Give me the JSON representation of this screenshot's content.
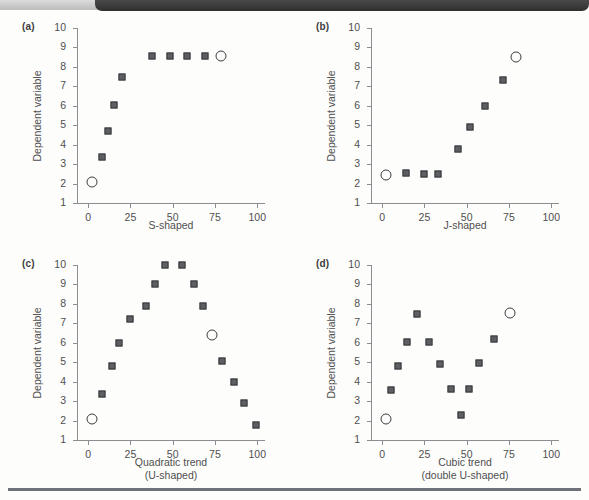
{
  "figure": {
    "background_color": "#fdfdfc",
    "banner_color": "#3b3b3b",
    "rule_color": "#6e7278",
    "marker_fill": "#5d5f63",
    "marker_edge": "#36383b",
    "axis_color": "#8b8d90"
  },
  "panels": [
    {
      "id": "a",
      "label": "(a)",
      "ylabel": "Dependent variable",
      "xlabel_line1": "S-shaped",
      "xlabel_line2": ""
    },
    {
      "id": "b",
      "label": "(b)",
      "ylabel": "Dependent variable",
      "xlabel_line1": "J-shaped",
      "xlabel_line2": ""
    },
    {
      "id": "c",
      "label": "(c)",
      "ylabel": "Dependent variable",
      "xlabel_line1": "Quadratic trend",
      "xlabel_line2": "(U-shaped)"
    },
    {
      "id": "d",
      "label": "(d)",
      "ylabel": "Dependent variable",
      "xlabel_line1": "Cubic trend",
      "xlabel_line2": "(double U-shaped)"
    }
  ],
  "axes": {
    "x_ticks": [
      0,
      25,
      50,
      75,
      100
    ],
    "x_tick_labels": [
      "0",
      "25",
      "50",
      "75",
      "100"
    ],
    "xlim": [
      -6,
      104
    ],
    "y_ticks": [
      1,
      2,
      3,
      4,
      5,
      6,
      7,
      8,
      9,
      10
    ],
    "y_tick_labels": [
      "1",
      "2",
      "3",
      "4",
      "5",
      "6",
      "7",
      "8",
      "9",
      "10"
    ],
    "ylim": [
      1,
      10
    ],
    "grid": false
  },
  "chart_data": [
    {
      "type": "scatter",
      "panel": "a",
      "title": "(a)",
      "xlabel": "S-shaped",
      "ylabel": "Dependent variable",
      "xlim": [
        -6,
        104
      ],
      "ylim": [
        1,
        10
      ],
      "xticks": [
        0,
        25,
        50,
        75,
        100
      ],
      "yticks": [
        1,
        2,
        3,
        4,
        5,
        6,
        7,
        8,
        9,
        10
      ],
      "grid": false,
      "legend": "none",
      "series": [
        {
          "name": "filled-squares",
          "marker": "square",
          "points": [
            {
              "x": 8,
              "y": 3.35
            },
            {
              "x": 11.5,
              "y": 4.7
            },
            {
              "x": 15.5,
              "y": 6.05
            },
            {
              "x": 20,
              "y": 7.5
            },
            {
              "x": 38,
              "y": 8.55
            },
            {
              "x": 48.5,
              "y": 8.55
            },
            {
              "x": 58.5,
              "y": 8.55
            },
            {
              "x": 69,
              "y": 8.55
            }
          ]
        },
        {
          "name": "open-circles",
          "marker": "circle",
          "points": [
            {
              "x": 2.5,
              "y": 2.1
            },
            {
              "x": 78.5,
              "y": 8.55
            }
          ]
        }
      ]
    },
    {
      "type": "scatter",
      "panel": "b",
      "title": "(b)",
      "xlabel": "J-shaped",
      "ylabel": "Dependent variable",
      "xlim": [
        -6,
        104
      ],
      "ylim": [
        1,
        10
      ],
      "xticks": [
        0,
        25,
        50,
        75,
        100
      ],
      "yticks": [
        1,
        2,
        3,
        4,
        5,
        6,
        7,
        8,
        9,
        10
      ],
      "grid": false,
      "legend": "none",
      "series": [
        {
          "name": "filled-squares",
          "marker": "square",
          "points": [
            {
              "x": 14,
              "y": 2.52
            },
            {
              "x": 24.5,
              "y": 2.48
            },
            {
              "x": 33,
              "y": 2.48
            },
            {
              "x": 45,
              "y": 3.8
            },
            {
              "x": 52,
              "y": 4.9
            },
            {
              "x": 61,
              "y": 6.0
            },
            {
              "x": 71.5,
              "y": 7.35
            }
          ]
        },
        {
          "name": "open-circles",
          "marker": "circle",
          "points": [
            {
              "x": 2.5,
              "y": 2.45
            },
            {
              "x": 79,
              "y": 8.5
            }
          ]
        }
      ]
    },
    {
      "type": "scatter",
      "panel": "c",
      "title": "(c)",
      "xlabel": "Quadratic trend (U-shaped)",
      "ylabel": "Dependent variable",
      "xlim": [
        -6,
        104
      ],
      "ylim": [
        1,
        10
      ],
      "xticks": [
        0,
        25,
        50,
        75,
        100
      ],
      "yticks": [
        1,
        2,
        3,
        4,
        5,
        6,
        7,
        8,
        9,
        10
      ],
      "grid": false,
      "legend": "none",
      "series": [
        {
          "name": "filled-squares",
          "marker": "square",
          "points": [
            {
              "x": 8,
              "y": 3.35
            },
            {
              "x": 14,
              "y": 4.8
            },
            {
              "x": 18.5,
              "y": 6.0
            },
            {
              "x": 24.5,
              "y": 7.2
            },
            {
              "x": 34.5,
              "y": 7.9
            },
            {
              "x": 39.5,
              "y": 9.0
            },
            {
              "x": 45.5,
              "y": 10.0
            },
            {
              "x": 55.5,
              "y": 10.0
            },
            {
              "x": 62.5,
              "y": 9.0
            },
            {
              "x": 68,
              "y": 7.9
            },
            {
              "x": 79,
              "y": 5.05
            },
            {
              "x": 86.5,
              "y": 4.0
            },
            {
              "x": 92,
              "y": 2.9
            },
            {
              "x": 99.5,
              "y": 1.75
            }
          ]
        },
        {
          "name": "open-circles",
          "marker": "circle",
          "points": [
            {
              "x": 2.5,
              "y": 2.1
            },
            {
              "x": 73,
              "y": 6.4
            }
          ]
        }
      ]
    },
    {
      "type": "scatter",
      "panel": "d",
      "title": "(d)",
      "xlabel": "Cubic trend (double U-shaped)",
      "ylabel": "Dependent variable",
      "xlim": [
        -6,
        104
      ],
      "ylim": [
        1,
        10
      ],
      "xticks": [
        0,
        25,
        50,
        75,
        100
      ],
      "yticks": [
        1,
        2,
        3,
        4,
        5,
        6,
        7,
        8,
        9,
        10
      ],
      "grid": false,
      "legend": "none",
      "series": [
        {
          "name": "filled-squares",
          "marker": "square",
          "points": [
            {
              "x": 5.5,
              "y": 3.55
            },
            {
              "x": 9.5,
              "y": 4.8
            },
            {
              "x": 14.5,
              "y": 6.05
            },
            {
              "x": 20.5,
              "y": 7.5
            },
            {
              "x": 28,
              "y": 6.05
            },
            {
              "x": 34.5,
              "y": 4.9
            },
            {
              "x": 40.5,
              "y": 3.6
            },
            {
              "x": 46.5,
              "y": 2.3
            },
            {
              "x": 51.5,
              "y": 3.6
            },
            {
              "x": 57.5,
              "y": 4.95
            },
            {
              "x": 66,
              "y": 6.2
            }
          ]
        },
        {
          "name": "open-circles",
          "marker": "circle",
          "points": [
            {
              "x": 2.5,
              "y": 2.1
            },
            {
              "x": 75.5,
              "y": 7.55
            }
          ]
        }
      ]
    }
  ]
}
